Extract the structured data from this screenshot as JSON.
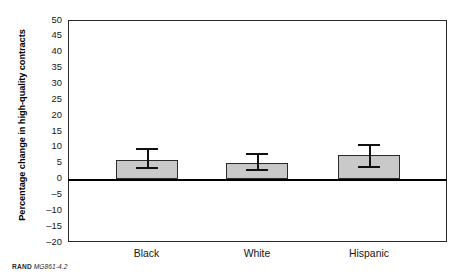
{
  "chart_data": {
    "type": "bar",
    "title": "",
    "subtitle": "",
    "xlabel": "",
    "ylabel": "Percentage change in high-quality contracts",
    "categories": [
      "Black",
      "White",
      "Hispanic"
    ],
    "values": [
      6.0,
      5.0,
      7.5
    ],
    "series": [
      {
        "name": "Percentage change in high-quality contracts",
        "values": [
          6.0,
          5.0,
          7.5
        ],
        "error_low": [
          3.5,
          3.0,
          4.0
        ],
        "error_high": [
          9.5,
          8.0,
          11.0
        ]
      }
    ],
    "error_bars": [
      {
        "category": "Black",
        "value": 6.0,
        "lower": 3.5,
        "upper": 9.5
      },
      {
        "category": "White",
        "value": 5.0,
        "lower": 3.0,
        "upper": 8.0
      },
      {
        "category": "Hispanic",
        "value": 7.5,
        "lower": 4.0,
        "upper": 11.0
      }
    ],
    "ylim": [
      -20,
      50
    ],
    "ytick_step": 5,
    "ytick_labels": [
      "50",
      "45",
      "40",
      "35",
      "30",
      "25",
      "20",
      "15",
      "10",
      "5",
      "0",
      "–5",
      "–10",
      "–15",
      "–20"
    ],
    "ytick_values": [
      50,
      45,
      40,
      35,
      30,
      25,
      20,
      15,
      10,
      5,
      0,
      -5,
      -10,
      -15,
      -20
    ],
    "grid": false,
    "legend": null,
    "zero_line": 0,
    "bar_fill_color": "#c9c9c9",
    "bar_edge_color": "#2a2a2a",
    "error_bar_color": "#111111",
    "axis_color": "#2b2b2b"
  },
  "credit": {
    "org": "RAND",
    "figure_id": "MG861-4.2"
  }
}
